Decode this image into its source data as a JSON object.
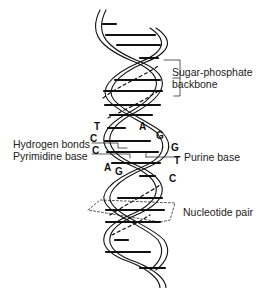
{
  "diagram": {
    "type": "dna-double-helix",
    "labels": {
      "backbone_line1": "Sugar-phosphate",
      "backbone_line2": "backbone",
      "hydrogen_bonds": "Hydrogen bonds",
      "pyrimidine_base": "Pyrimidine base",
      "purine_base": "Purine base",
      "nucleotide_pair": "Nucleotide pair"
    },
    "bases": {
      "left": [
        "T",
        "C",
        "C",
        "A"
      ],
      "right": [
        "A",
        "G",
        "G",
        "T",
        "C"
      ],
      "bottom_left": "G"
    },
    "colors": {
      "ink": "#111111",
      "background": "#ffffff"
    }
  }
}
